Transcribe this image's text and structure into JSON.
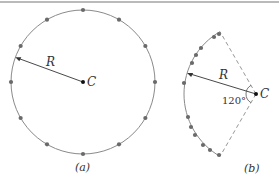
{
  "colors": {
    "line": "#8a8a8a",
    "dot": "#6a6a6a",
    "text": "#333333",
    "center": "#111111",
    "rule": "#777777"
  },
  "panel_a": {
    "caption": "(a)",
    "center_label": "C",
    "radius_label": "R",
    "center": [
      83,
      82
    ],
    "radius": 72,
    "dot_count": 12
  },
  "panel_b": {
    "caption": "(b)",
    "center_label": "C",
    "radius_label": "R",
    "angle_label": "120°",
    "center": [
      256,
      94
    ],
    "radius": 72,
    "sector_angle_deg": 120,
    "dots": [
      [
        219,
        34
      ],
      [
        214,
        37
      ],
      [
        201,
        48
      ],
      [
        196,
        55
      ],
      [
        192,
        63
      ],
      [
        184,
        83
      ],
      [
        188,
        117
      ],
      [
        191,
        127
      ],
      [
        195,
        135
      ],
      [
        203,
        145
      ],
      [
        210,
        150
      ],
      [
        219,
        155
      ]
    ]
  }
}
